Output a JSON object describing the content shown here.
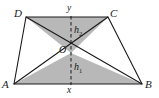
{
  "figure": {
    "vertices": {
      "A": {
        "label": "A",
        "x": 14,
        "y": 84
      },
      "B": {
        "label": "B",
        "x": 142,
        "y": 84
      },
      "C": {
        "label": "C",
        "x": 108,
        "y": 17
      },
      "D": {
        "label": "D",
        "x": 26,
        "y": 17
      },
      "O": {
        "label": "O",
        "x": 71,
        "y": 53
      }
    },
    "labels": {
      "top_base": "y",
      "bottom_base": "x",
      "upper_height": "h",
      "upper_height_sub": "2",
      "lower_height": "h",
      "lower_height_sub": "1",
      "vertex_a": "A",
      "vertex_b": "B",
      "vertex_c": "C",
      "vertex_d": "D",
      "vertex_o": "O"
    },
    "colors": {
      "stroke": "#1a1a1a",
      "shade_fill": "#b8b8b8",
      "background": "#ffffff",
      "dashed": "#1a1a1a"
    },
    "shaded_regions": [
      {
        "name": "triangle-DOC",
        "points": "26,17 108,17 71,53"
      },
      {
        "name": "triangle-AOB",
        "points": "14,84 142,84 71,53"
      }
    ],
    "outline": {
      "name": "trapezoid-ABCD",
      "points": "14,84 142,84 108,17 26,17"
    },
    "diagonals": [
      {
        "name": "diagonal-AC",
        "x1": 14,
        "y1": 84,
        "x2": 108,
        "y2": 17
      },
      {
        "name": "diagonal-BD",
        "x1": 142,
        "y1": 84,
        "x2": 26,
        "y2": 17
      }
    ],
    "dashed_axis": {
      "name": "height-axis",
      "x": 71,
      "y1": 17,
      "y2": 84
    }
  }
}
